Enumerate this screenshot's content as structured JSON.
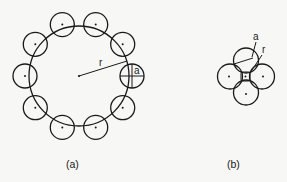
{
  "figure": {
    "panel_a": {
      "caption": "(a)",
      "ring_radius_label": "r",
      "particle_radius_label": "a",
      "particle_count": 10
    },
    "panel_b": {
      "caption": "(b)",
      "ring_radius_label": "r",
      "particle_radius_label": "a",
      "particle_count": 4
    }
  },
  "colors": {
    "ink": "#1a1a1a",
    "paper": "#f7f7f5"
  }
}
